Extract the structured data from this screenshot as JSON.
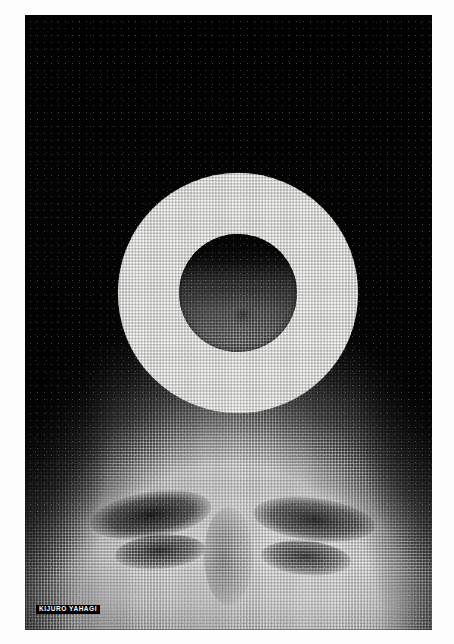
{
  "artwork": {
    "medium": "halftone screen print poster",
    "palette": {
      "paper": "#fdfdfd",
      "ink_black": "#070707",
      "ring_white": "#fcfcfa",
      "inner_gray": "#9a9a9a"
    },
    "composition": {
      "background_label": "dark halftone portrait of a face",
      "ring_label": "white annulus / eclipse ring",
      "inner_disc_label": "gray halftone disc inside ring"
    }
  },
  "signature": {
    "text": "KIJURO YAHAGI"
  },
  "geometry": {
    "poster": {
      "left": 25,
      "top": 15,
      "width": 407,
      "height": 615
    },
    "ring": {
      "center_x": 213,
      "center_y": 278,
      "outer_radius": 120,
      "inner_radius": 59
    }
  }
}
